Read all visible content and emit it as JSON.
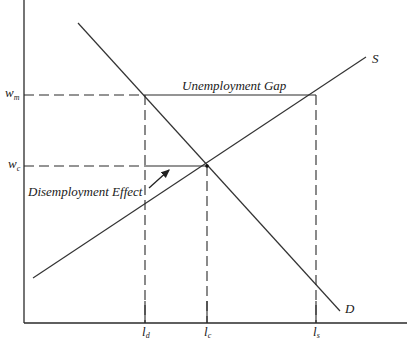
{
  "diagram": {
    "curves": {
      "supply": {
        "label": "S"
      },
      "demand": {
        "label": "D"
      }
    },
    "y_axis": {
      "ticks": [
        {
          "id": "wm",
          "base": "w",
          "sub": "m"
        },
        {
          "id": "wc",
          "base": "w",
          "sub": "c"
        }
      ]
    },
    "x_axis": {
      "ticks": [
        {
          "id": "ld",
          "base": "l",
          "sub": "d"
        },
        {
          "id": "lc",
          "base": "l",
          "sub": "c"
        },
        {
          "id": "ls",
          "base": "l",
          "sub": "s"
        }
      ]
    },
    "annotations": {
      "unemployment_gap": "Unemployment Gap",
      "disemployment_effect": "Disemployment Effect"
    },
    "colors": {
      "line": "#333333",
      "background": "#ffffff"
    }
  }
}
